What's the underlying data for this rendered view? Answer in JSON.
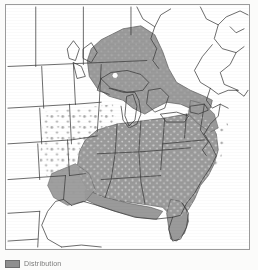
{
  "figure": {
    "name": "species-distribution-map",
    "region_described": "Eastern North America",
    "frame": {
      "border_color": "#9b9b9b",
      "background_color": "#ffffff"
    }
  },
  "map": {
    "title": "",
    "land_fill": "#ffffff",
    "outline_color": "#3a3a3a",
    "range_fill": "#9a9a9a",
    "range_outline": "#5d5d5d",
    "speckle_color": "#ffffff",
    "shaded_regions": [
      {
        "id": "ontario",
        "label": "Ontario",
        "type": "solid-shaded"
      },
      {
        "id": "midwest-south",
        "label": "Midwest and Southeastern United States",
        "type": "solid-shaded"
      },
      {
        "id": "great-plains-margin",
        "label": "Great Plains margin",
        "type": "speckled"
      },
      {
        "id": "atlantic-coast",
        "label": "Atlantic coastal plain",
        "type": "speckled"
      }
    ],
    "unshaded_regions": [
      {
        "id": "western-states",
        "label": "Western United States"
      },
      {
        "id": "quebec-maritimes",
        "label": "Quebec and Maritimes"
      },
      {
        "id": "new-england",
        "label": "New England"
      },
      {
        "id": "michigan-wisconsin",
        "label": "Michigan and Wisconsin"
      },
      {
        "id": "mexico",
        "label": "Mexico"
      }
    ]
  },
  "legend": {
    "swatch_color": "#8f8f8f",
    "label": "Distribution"
  }
}
